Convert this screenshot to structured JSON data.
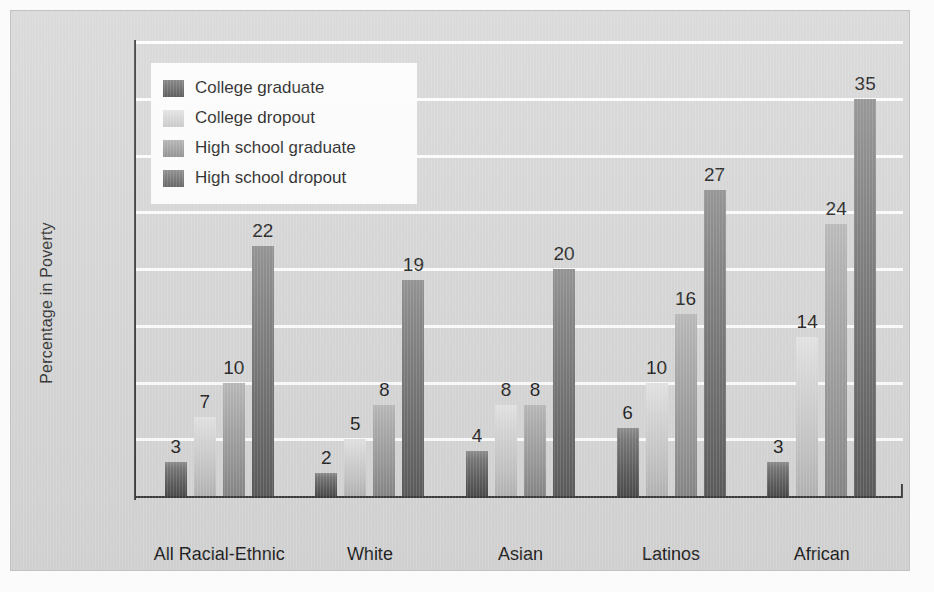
{
  "chart_data": {
    "type": "bar",
    "title": "",
    "xlabel": "",
    "ylabel": "Percentage in Poverty",
    "ylim": [
      0,
      40
    ],
    "grid": true,
    "legend_position": "top-left",
    "categories": [
      "All Racial-Ethnic Groups",
      "White Americans",
      "Asian Americans",
      "Latinos",
      "African Americans"
    ],
    "category_lines": [
      [
        "All Racial-Ethnic",
        "Groups"
      ],
      [
        "White",
        "Americans"
      ],
      [
        "Asian",
        "Americans"
      ],
      [
        "Latinos",
        ""
      ],
      [
        "African",
        "Americans"
      ]
    ],
    "series": [
      {
        "name": "College graduate",
        "values": [
          3,
          2,
          4,
          6,
          3
        ],
        "color": "#5e5e5e"
      },
      {
        "name": "College dropout",
        "values": [
          7,
          5,
          8,
          10,
          14
        ],
        "color": "#d2d2d2"
      },
      {
        "name": "High school graduate",
        "values": [
          10,
          8,
          8,
          16,
          24
        ],
        "color": "#9a9a9a"
      },
      {
        "name": "High school dropout",
        "values": [
          22,
          19,
          20,
          27,
          35
        ],
        "color": "#6b6b6b"
      }
    ],
    "ytick_labels": [
      "40%",
      "35%",
      "30%",
      "25%",
      "20%",
      "15%",
      "10%",
      "5%",
      "0"
    ],
    "ytick_values": [
      40,
      35,
      30,
      25,
      20,
      15,
      10,
      5,
      0
    ],
    "data_labels": [
      [
        3,
        7,
        10,
        22
      ],
      [
        2,
        5,
        8,
        19
      ],
      [
        4,
        8,
        8,
        20
      ],
      [
        6,
        10,
        16,
        27
      ],
      [
        3,
        14,
        24,
        35
      ]
    ]
  },
  "legend": {
    "items": [
      {
        "label": "College graduate"
      },
      {
        "label": "College dropout"
      },
      {
        "label": "High school graduate"
      },
      {
        "label": "High school dropout"
      }
    ]
  }
}
